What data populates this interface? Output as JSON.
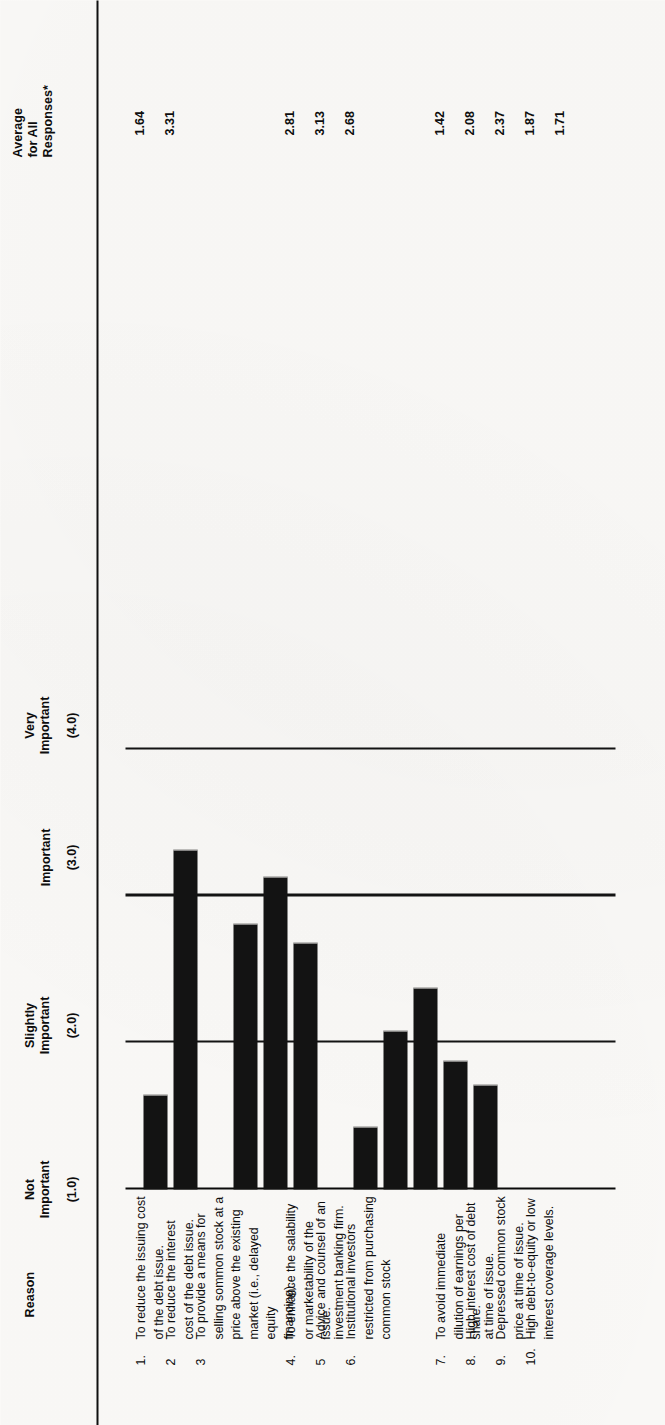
{
  "figure": {
    "orientation": "rotated-90-ccw",
    "columns": {
      "reason_header": "Reason",
      "average_header": "Average\nfor All\nResponses*"
    },
    "scale": {
      "captions": [
        {
          "label": "Not\nImportant",
          "value": "(1.0)"
        },
        {
          "label": "Slightly\nImportant",
          "value": "(2.0)"
        },
        {
          "label": "Important",
          "value": "(3.0)"
        },
        {
          "label": "Very\nImportant",
          "value": "(4.0)"
        }
      ]
    },
    "rows": [
      {
        "num": "1.",
        "text": "To reduce the issuing cost of the debt issue.",
        "avg": "1.64"
      },
      {
        "num": "2",
        "text": "To reduce the interest cost of the debt issue.",
        "avg": "3.31"
      },
      {
        "num": "3",
        "text": "To provide a means for selling sommon stock at a\nprice above the existing market (i.e., delayed equity\nfinancing).",
        "avg": ""
      },
      {
        "num": "4.",
        "text": "To enhance the salability or marketability of the issue.",
        "avg": "2.81"
      },
      {
        "num": "5",
        "text": "Advice and counsel of an investment banking firm.",
        "avg": "3.13"
      },
      {
        "num": "6.",
        "text": "Institutional investors restricted from purchasing\ncommon stock",
        "avg": "2.68"
      },
      {
        "num": "7.",
        "text": "To avoid immediate dilution of earnings per share.",
        "avg": "1.42"
      },
      {
        "num": "8.",
        "text": "High interest cost of debt at time of issue.",
        "avg": "2.08"
      },
      {
        "num": "9.",
        "text": "Depressed common stock price at time of issue.",
        "avg": "2.37"
      },
      {
        "num": "10.",
        "text": "High debt-to-equity or low interest coverage levels.",
        "avg": "1.87"
      },
      {
        "num": "",
        "text": "",
        "avg": "1.71"
      }
    ],
    "colors": {
      "bar": "#131313",
      "axis": "#0a0a0a",
      "paper": "#fbfaf8",
      "ink": "#0e0e0e"
    }
  },
  "chart_data": {
    "type": "bar",
    "title": "",
    "xlabel": "Reason",
    "ylabel": "Average for All Responses*",
    "ylim": [
      1.0,
      4.0
    ],
    "grid": true,
    "legend": "none",
    "tick_values": [
      1.0,
      2.0,
      3.0,
      4.0
    ],
    "tick_labels": [
      "(1.0)",
      "(2.0)",
      "(3.0)",
      "(4.0)"
    ],
    "tick_captions": [
      "Not Important",
      "Slightly Important",
      "Important",
      "Very Important"
    ],
    "categories": [
      "1",
      "2",
      "4",
      "5",
      "6",
      "7",
      "8",
      "9",
      "10",
      "11"
    ],
    "category_labels": [
      "To reduce the issuing cost of the debt issue.",
      "To reduce the interest cost of the debt issue.",
      "To enhance the salability or marketability of the issue.",
      "Advice and counsel of an investment banking firm.",
      "Institutional investors restricted from purchasing common stock",
      "To avoid immediate dilution of earnings per share.",
      "High interest cost of debt at time of issue.",
      "Depressed common stock price at time of issue.",
      "High debt-to-equity or low interest coverage levels.",
      ""
    ],
    "values": [
      1.64,
      3.31,
      2.81,
      3.13,
      2.68,
      1.42,
      2.08,
      2.37,
      1.87,
      1.71
    ],
    "value_labels": [
      "1.64",
      "3.31",
      "2.81",
      "3.13",
      "2.68",
      "1.42",
      "2.08",
      "2.37",
      "1.87",
      "1.71"
    ]
  }
}
